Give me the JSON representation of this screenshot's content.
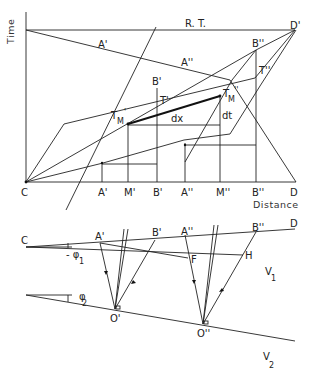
{
  "diagram": {
    "top": {
      "axis_y_label": "Time",
      "axis_x_label": "Distance",
      "rt_label": "R. T.",
      "origin_label": "C",
      "end_label": "D",
      "corner_label": "D'",
      "bottom_points": [
        "A'",
        "M'",
        "B'",
        "A''",
        "M''",
        "B''",
        "D"
      ],
      "points": {
        "a1": "A'",
        "a2": "A''",
        "b1": "B'",
        "b2": "B''",
        "t1": "T'",
        "t2": "T''",
        "tm1": "T",
        "tm1_sub": "M",
        "tm1_sup": "'",
        "tm2": "T",
        "tm2_sub": "M",
        "tm2_sup": "''",
        "dx": "dx",
        "dt": "dt"
      }
    },
    "bottom": {
      "c": "C",
      "d": "D",
      "a1": "A'",
      "b1": "B'",
      "a2": "A''",
      "b2": "B''",
      "f": "F",
      "h": "H",
      "o1": "O'",
      "o2": "O''",
      "phi1": "- φ",
      "phi1_sub": "1",
      "phi2": "φ",
      "phi2_sub": "2",
      "v1": "V",
      "v1_sub": "1",
      "v2": "V",
      "v2_sub": "2"
    }
  }
}
